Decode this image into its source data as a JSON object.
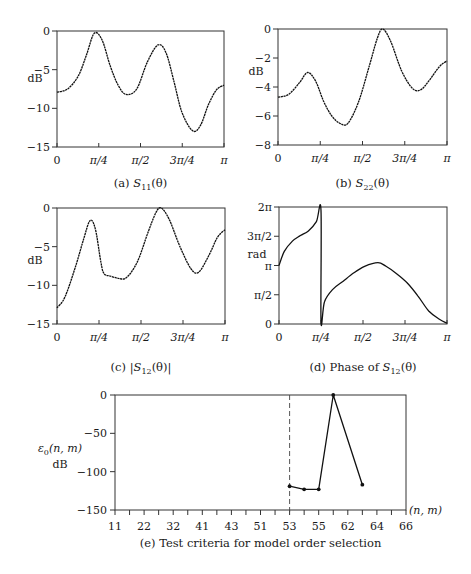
{
  "chart_data": [
    {
      "id": "a",
      "type": "line",
      "caption": "(a) S11(θ)",
      "caption_prefix": "(a) ",
      "caption_sym": "S",
      "caption_sub": "11",
      "caption_suffix": "(θ)",
      "ylabel": "dB",
      "xlabel": "",
      "ylim": [
        -15,
        0
      ],
      "xlim": [
        0,
        3.14159
      ],
      "yticks": [
        "0",
        "-5",
        "-10",
        "-15"
      ],
      "xticks": [
        "0",
        "π/4",
        "π/2",
        "3π/4",
        "π"
      ],
      "x": [
        0,
        0.2,
        0.4,
        0.55,
        0.7,
        0.85,
        1.0,
        1.15,
        1.3,
        1.5,
        1.7,
        1.9,
        2.05,
        2.2,
        2.35,
        2.55,
        2.7,
        2.85,
        3.0,
        3.14
      ],
      "values": [
        -7.9,
        -7.5,
        -5.8,
        -3.2,
        -0.3,
        -1.2,
        -4.5,
        -7.0,
        -8.2,
        -7.5,
        -4.0,
        -1.8,
        -2.8,
        -6.5,
        -10.5,
        -12.9,
        -12.2,
        -9.5,
        -7.6,
        -7.0
      ]
    },
    {
      "id": "b",
      "type": "line",
      "caption": "(b) S22(θ)",
      "caption_prefix": "(b) ",
      "caption_sym": "S",
      "caption_sub": "22",
      "caption_suffix": "(θ)",
      "ylabel": "dB",
      "xlabel": "",
      "ylim": [
        -8,
        0
      ],
      "xlim": [
        0,
        3.14159
      ],
      "yticks": [
        "0",
        "-2",
        "-4",
        "-6",
        "-8"
      ],
      "xticks": [
        "0",
        "π/4",
        "π/2",
        "3π/4",
        "π"
      ],
      "x": [
        0,
        0.2,
        0.4,
        0.55,
        0.7,
        0.85,
        1.0,
        1.15,
        1.3,
        1.5,
        1.7,
        1.85,
        1.95,
        2.1,
        2.3,
        2.5,
        2.65,
        2.8,
        3.0,
        3.14
      ],
      "values": [
        -4.7,
        -4.5,
        -3.7,
        -3.0,
        -3.6,
        -5.0,
        -6.0,
        -6.5,
        -6.5,
        -5.0,
        -2.5,
        -0.6,
        0.0,
        -0.9,
        -2.9,
        -4.1,
        -4.2,
        -3.6,
        -2.6,
        -2.2
      ]
    },
    {
      "id": "c",
      "type": "line",
      "caption": "(c) |S12(θ)|",
      "caption_prefix": "(c) |",
      "caption_sym": "S",
      "caption_sub": "12",
      "caption_suffix": "(θ)|",
      "ylabel": "dB",
      "xlabel": "",
      "ylim": [
        -15,
        0
      ],
      "xlim": [
        0,
        3.14159
      ],
      "yticks": [
        "0",
        "-5",
        "-10",
        "-15"
      ],
      "xticks": [
        "0",
        "π/4",
        "π/2",
        "3π/4",
        "π"
      ],
      "x": [
        0,
        0.15,
        0.35,
        0.5,
        0.62,
        0.72,
        0.82,
        0.88,
        1.0,
        1.15,
        1.3,
        1.5,
        1.7,
        1.85,
        1.95,
        2.1,
        2.3,
        2.5,
        2.65,
        2.85,
        3.0,
        3.14
      ],
      "values": [
        -12.9,
        -11.5,
        -7.5,
        -4.0,
        -1.6,
        -2.8,
        -7.0,
        -8.5,
        -8.8,
        -9.1,
        -9.0,
        -7.0,
        -3.2,
        -0.6,
        0.0,
        -1.5,
        -5.0,
        -7.8,
        -8.3,
        -6.0,
        -3.8,
        -2.8
      ]
    },
    {
      "id": "d",
      "type": "line",
      "caption": "(d) Phase of S12(θ)",
      "caption_prefix": "(d) Phase of ",
      "caption_sym": "S",
      "caption_sub": "12",
      "caption_suffix": "(θ)",
      "ylabel": "rad",
      "xlabel": "",
      "ylim": [
        0,
        6.2832
      ],
      "xlim": [
        0,
        3.14159
      ],
      "yticks": [
        "2π",
        "3π/2",
        "π",
        "π/2",
        "0"
      ],
      "xticks": [
        "0",
        "π/4",
        "π/2",
        "3π/4",
        "π"
      ],
      "x": [
        0,
        0.1,
        0.25,
        0.4,
        0.55,
        0.7,
        0.785,
        0.786,
        0.85,
        1.0,
        1.2,
        1.4,
        1.6,
        1.85,
        2.0,
        2.2,
        2.4,
        2.6,
        2.8,
        3.0,
        3.14
      ],
      "values": [
        3.14,
        3.9,
        4.45,
        4.75,
        5.0,
        5.5,
        6.1,
        0.15,
        1.2,
        1.85,
        2.3,
        2.75,
        3.1,
        3.3,
        3.1,
        2.7,
        2.2,
        1.5,
        0.7,
        0.25,
        0.05
      ]
    },
    {
      "id": "e",
      "type": "line",
      "caption": "(e) Test criteria for model order selection",
      "ylabel": "ε0(n, m) dB",
      "ylabel_sym": "ε",
      "ylabel_sub": "0",
      "ylabel_args": "(n, m)",
      "ylabel_unit": "dB",
      "xlabel": "(n, m)",
      "ylim": [
        -150,
        0
      ],
      "yticks": [
        "0",
        "-50",
        "-100",
        "-150"
      ],
      "xticks": [
        "11",
        "22",
        "32",
        "41",
        "43",
        "51",
        "53",
        "55",
        "62",
        "64",
        "66"
      ],
      "dashed_line_at": "53",
      "x_index": [
        12,
        13,
        14,
        15,
        17
      ],
      "values": [
        -119,
        -123,
        -123,
        0,
        -117
      ]
    }
  ]
}
